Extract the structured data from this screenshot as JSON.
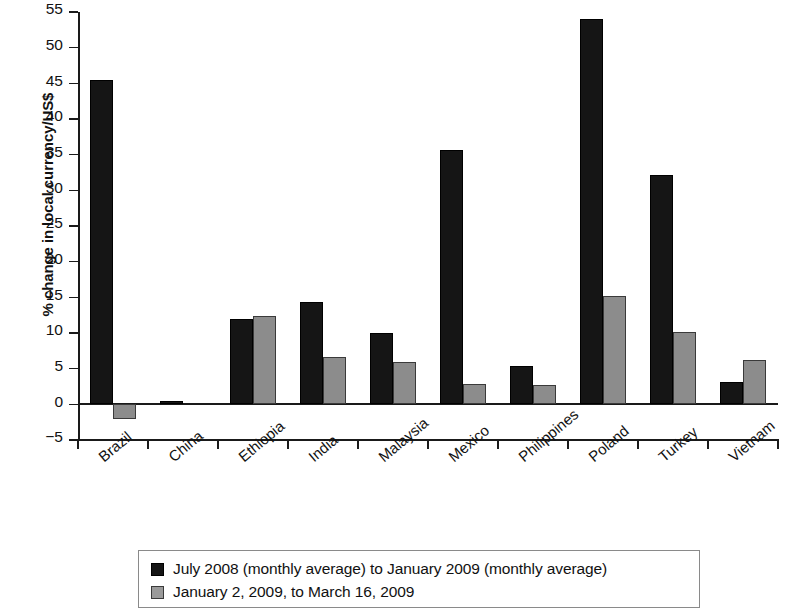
{
  "chart_data": {
    "type": "bar",
    "title": "",
    "xlabel": "",
    "ylabel": "% change in local currency/US$",
    "ylim": [
      -5,
      55
    ],
    "ytick_step": 5,
    "yticks": [
      55,
      50,
      45,
      40,
      35,
      30,
      25,
      20,
      15,
      10,
      5,
      0,
      -5
    ],
    "ytick_labels": [
      "55",
      "50",
      "45",
      "40",
      "35",
      "30",
      "25",
      "20",
      "15",
      "10",
      "5",
      "0",
      "−5"
    ],
    "grid": false,
    "legend_position": "bottom",
    "categories": [
      "Brazil",
      "China",
      "Ethiopia",
      "India",
      "Malaysia",
      "Mexico",
      "Philippines",
      "Poland",
      "Turkey",
      "Vietnam"
    ],
    "series": [
      {
        "name": "July 2008 (monthly average) to January 2009 (monthly average)",
        "color": "#151515",
        "values": [
          45.5,
          0.5,
          12.0,
          14.3,
          10.0,
          35.7,
          5.4,
          54.0,
          32.1,
          3.1
        ]
      },
      {
        "name": "January 2, 2009, to March 16, 2009",
        "color": "#8c8c8c",
        "values": [
          -2.1,
          0.0,
          12.4,
          6.7,
          5.9,
          2.8,
          2.7,
          15.2,
          10.1,
          6.2
        ]
      }
    ]
  },
  "legend": {
    "items": [
      {
        "swatch": "dark",
        "label": "July 2008 (monthly average) to January 2009 (monthly average)"
      },
      {
        "swatch": "light",
        "label": "January 2, 2009, to March 16, 2009"
      }
    ]
  }
}
